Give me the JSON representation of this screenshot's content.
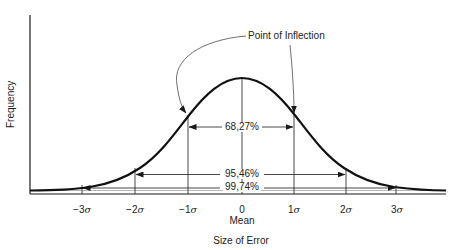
{
  "figure": {
    "ylabel": "Frequency",
    "xlabel": "Size of Error",
    "annotation": "Point of Inflection",
    "mean_label": "Mean",
    "ticks": [
      {
        "value": "−3",
        "sigma": "σ"
      },
      {
        "value": "−2",
        "sigma": "σ"
      },
      {
        "value": "−1",
        "sigma": "σ"
      },
      {
        "value": "0",
        "sigma": ""
      },
      {
        "value": "1",
        "sigma": "σ"
      },
      {
        "value": "2",
        "sigma": "σ"
      },
      {
        "value": "3",
        "sigma": "σ"
      }
    ],
    "intervals": [
      {
        "range": "±1σ",
        "label": "68,27%"
      },
      {
        "range": "±2σ",
        "label": "95,46%"
      },
      {
        "range": "±3σ",
        "label": "99,74%"
      }
    ],
    "colors": {
      "line": "#1a1a1a",
      "background": "#ffffff"
    }
  }
}
